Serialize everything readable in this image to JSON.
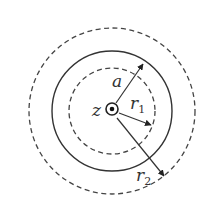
{
  "diagram": {
    "type": "concentric-circles",
    "colors": {
      "stroke": "#333333",
      "background": "#ffffff"
    },
    "center": {
      "x": 112,
      "y": 111,
      "symbol": "out-of-page-dot"
    },
    "circles": [
      {
        "id": "outer",
        "style": "dashed",
        "r": 83
      },
      {
        "id": "conductor",
        "style": "solid",
        "r": 60
      },
      {
        "id": "inner",
        "style": "dashed",
        "r": 43
      }
    ],
    "labels": {
      "axis": "z",
      "radius_a": "a",
      "radius_r1": "r",
      "radius_r1_sub": "1",
      "radius_r2": "r",
      "radius_r2_sub": "2"
    }
  }
}
